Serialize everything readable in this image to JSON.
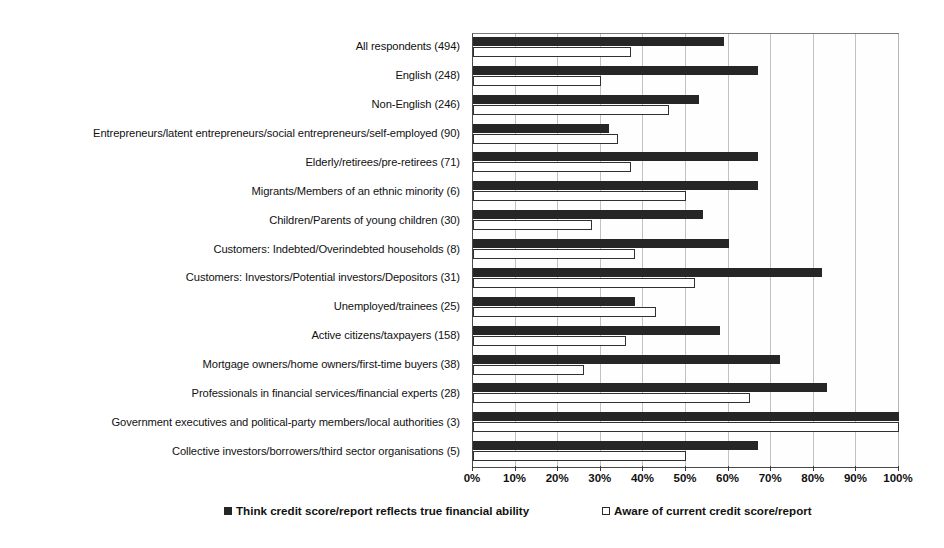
{
  "chart_data": {
    "type": "bar",
    "orientation": "horizontal",
    "title": "",
    "xlabel": "",
    "ylabel": "",
    "xlim": [
      0,
      100
    ],
    "xticks": [
      "0%",
      "10%",
      "20%",
      "30%",
      "40%",
      "50%",
      "60%",
      "70%",
      "80%",
      "90%",
      "100%"
    ],
    "xtick_values": [
      0,
      10,
      20,
      30,
      40,
      50,
      60,
      70,
      80,
      90,
      100
    ],
    "grid": true,
    "legend_position": "bottom",
    "categories": [
      "All respondents (494)",
      "English (248)",
      "Non-English (246)",
      "Entrepreneurs/latent entrepreneurs/social entrepreneurs/self-employed (90)",
      "Elderly/retirees/pre-retirees (71)",
      "Migrants/Members of an ethnic minority (6)",
      "Children/Parents of young children (30)",
      "Customers: Indebted/Overindebted households (8)",
      "Customers: Investors/Potential investors/Depositors (31)",
      "Unemployed/trainees (25)",
      "Active citizens/taxpayers (158)",
      "Mortgage owners/home owners/first-time buyers (38)",
      "Professionals in financial services/financial experts (28)",
      "Government executives and political-party members/local authorities (3)",
      "Collective investors/borrowers/third sector organisations (5)"
    ],
    "series": [
      {
        "name": "Think credit score/report reflects true financial ability",
        "color": "#262626",
        "values": [
          59,
          67,
          53,
          32,
          67,
          67,
          54,
          60,
          82,
          38,
          58,
          72,
          83,
          100,
          67
        ]
      },
      {
        "name": "Aware of current credit score/report",
        "color": "#ffffff",
        "values": [
          37,
          30,
          46,
          34,
          37,
          50,
          28,
          38,
          52,
          43,
          36,
          26,
          65,
          100,
          50
        ]
      }
    ]
  },
  "legend": {
    "items": [
      {
        "label": "Think credit score/report reflects true financial ability",
        "marker": "filled-square-marker"
      },
      {
        "label": "Aware of current credit score/report",
        "marker": "hollow-square-marker"
      }
    ]
  }
}
